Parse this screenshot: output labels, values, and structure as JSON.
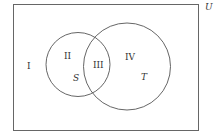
{
  "diagram": {
    "type": "venn",
    "universe_label": "U",
    "sets": [
      {
        "name": "S",
        "label": "S"
      },
      {
        "name": "T",
        "label": "T"
      }
    ],
    "regions": [
      {
        "id": "I",
        "label": "I",
        "description": "outside S and T"
      },
      {
        "id": "II",
        "label": "II",
        "description": "S only"
      },
      {
        "id": "III",
        "label": "III",
        "description": "S and T"
      },
      {
        "id": "IV",
        "label": "IV",
        "description": "T only"
      }
    ],
    "colors": {
      "stroke": "#555555",
      "background": "#ffffff"
    }
  }
}
